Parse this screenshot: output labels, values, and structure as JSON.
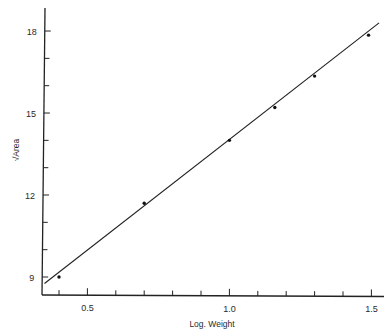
{
  "chart_data": {
    "type": "scatter",
    "title": "",
    "xlabel": "Log. Weight",
    "ylabel": "√Area",
    "xlim": [
      0.34,
      1.53
    ],
    "ylim": [
      8.35,
      19.0
    ],
    "x_ticks_major": [
      0.5,
      1.0,
      1.5
    ],
    "x_tick_labels": [
      "0.5",
      "1.0",
      "1.5"
    ],
    "x_ticks_minor": [
      0.4,
      0.6,
      0.7,
      0.8,
      0.9,
      1.1,
      1.2,
      1.3,
      1.4
    ],
    "y_ticks_major": [
      9,
      12,
      15,
      18
    ],
    "y_tick_labels": [
      "9",
      "12",
      "15",
      "18"
    ],
    "y_ticks_minor": [
      10,
      11,
      13,
      14,
      16,
      17
    ],
    "grid": false,
    "legend": null,
    "series": [
      {
        "name": "observations",
        "marker": "small dot",
        "points": [
          {
            "x": 0.4,
            "y": 9.0
          },
          {
            "x": 0.7,
            "y": 11.7
          },
          {
            "x": 1.0,
            "y": 14.0
          },
          {
            "x": 1.16,
            "y": 15.2
          },
          {
            "x": 1.3,
            "y": 16.35
          },
          {
            "x": 1.49,
            "y": 17.85
          }
        ]
      },
      {
        "name": "fitted line",
        "style": "solid line",
        "points": [
          {
            "x": 0.37,
            "y": 8.8
          },
          {
            "x": 1.52,
            "y": 18.3
          }
        ]
      }
    ]
  },
  "frame": {
    "px_left": 42,
    "px_bottom": 295,
    "px_top": 8,
    "px_right": 384,
    "x_px_per_unit": 284,
    "x_px_origin_value": 0.4,
    "x_px_origin": 59,
    "y_px_per_unit": 27.33,
    "y_px_origin_value": 9,
    "y_px_origin": 277
  }
}
